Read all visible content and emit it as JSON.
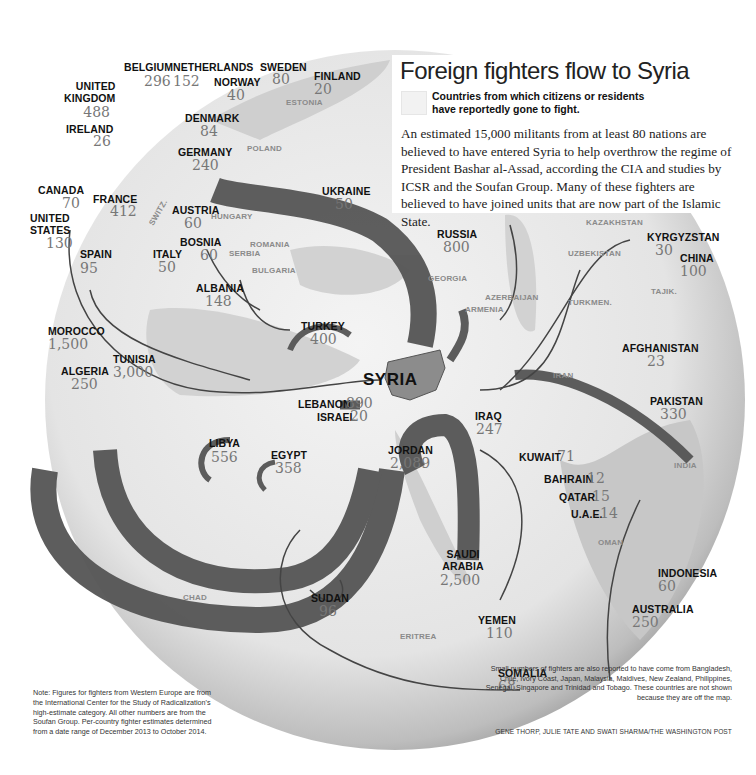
{
  "header": {
    "title": "Foreign fighters flow to Syria",
    "legend_label": "Countries from which citizens or residents have reportedly gone to fight.",
    "blurb": "An estimated 15,000 militants from at least 80 nations are believed to have entered Syria to help overthrow the regime of President Bashar al-Assad, according the CIA and studies by ICSR and the Soufan Group. Many of these fighters are believed to have joined units that are now part of the Islamic State."
  },
  "destination": {
    "label": "SYRIA"
  },
  "countries": [
    {
      "name": "UNITED KINGDOM",
      "line1": "UNITED",
      "line2": "KINGDOM",
      "value": "488"
    },
    {
      "name": "BELGIUM",
      "value": "296"
    },
    {
      "name": "NETHERLANDS",
      "value": "152"
    },
    {
      "name": "SWEDEN",
      "value": "80"
    },
    {
      "name": "FINLAND",
      "value": "20"
    },
    {
      "name": "NORWAY",
      "value": "40"
    },
    {
      "name": "DENMARK",
      "value": "84"
    },
    {
      "name": "IRELAND",
      "value": "26"
    },
    {
      "name": "GERMANY",
      "value": "240"
    },
    {
      "name": "CANADA",
      "value": "70"
    },
    {
      "name": "UNITED STATES",
      "line1": "UNITED",
      "line2": "STATES",
      "value": "130"
    },
    {
      "name": "FRANCE",
      "value": "412"
    },
    {
      "name": "AUSTRIA",
      "value": "60"
    },
    {
      "name": "BOSNIA",
      "value": "60"
    },
    {
      "name": "SPAIN",
      "value": "95"
    },
    {
      "name": "ITALY",
      "value": "50"
    },
    {
      "name": "ALBANIA",
      "value": "148"
    },
    {
      "name": "UKRAINE",
      "value": "50"
    },
    {
      "name": "RUSSIA",
      "value": "800"
    },
    {
      "name": "TURKEY",
      "value": "400"
    },
    {
      "name": "MOROCCO",
      "value": "1,500"
    },
    {
      "name": "ALGERIA",
      "value": "250"
    },
    {
      "name": "TUNISIA",
      "value": "3,000"
    },
    {
      "name": "LIBYA",
      "value": "556"
    },
    {
      "name": "EGYPT",
      "value": "358"
    },
    {
      "name": "LEBANON",
      "value": "890"
    },
    {
      "name": "ISRAEL",
      "value": "20"
    },
    {
      "name": "JORDAN",
      "value": "2,089"
    },
    {
      "name": "IRAQ",
      "value": "247"
    },
    {
      "name": "KUWAIT",
      "value": "71"
    },
    {
      "name": "BAHRAIN",
      "value": "12"
    },
    {
      "name": "QATAR",
      "value": "15"
    },
    {
      "name": "U.A.E.",
      "value": "14"
    },
    {
      "name": "SAUDI ARABIA",
      "line1": "SAUDI",
      "line2": "ARABIA",
      "value": "2,500"
    },
    {
      "name": "SUDAN",
      "value": "96"
    },
    {
      "name": "YEMEN",
      "value": "110"
    },
    {
      "name": "SOMALIA",
      "value": "68"
    },
    {
      "name": "KYRGYZSTAN",
      "value": "30"
    },
    {
      "name": "CHINA",
      "value": "100"
    },
    {
      "name": "AFGHANISTAN",
      "value": "23"
    },
    {
      "name": "PAKISTAN",
      "value": "330"
    },
    {
      "name": "INDONESIA",
      "value": "60"
    },
    {
      "name": "AUSTRALIA",
      "value": "250"
    }
  ],
  "geo_labels": [
    "ESTONIA",
    "POLAND",
    "HUNGARY",
    "SWITZ.",
    "ROMANIA",
    "SERBIA",
    "BULGARIA",
    "GEORGIA",
    "AZERBAIJAN",
    "ARMENIA",
    "KAZAKHSTAN",
    "UZBEKISTAN",
    "TURKMEN.",
    "TAJIK.",
    "IRAN",
    "INDIA",
    "OMAN",
    "CHAD",
    "ERITREA"
  ],
  "notes": {
    "left": "Note: Figures for fighters from Western Europe are from the International Center for the Study of Radicalization's high-estimate category. All other numbers are from the Soufan Group. Per-country fighter estimates determined from a date range of December 2013 to October 2014.",
    "right": "Small numbers of fighters are also reported to have come from Bangladesh, Chile, Ivory Coast, Japan, Malaysia, Maldives, New Zealand, Philippines, Senegal, Singapore and Trinidad and Tobago. These countries are not shown because they are off the map.",
    "credit": "GENE THORP, JULIE TATE AND SWATI SHARMA/THE WASHINGTON POST"
  },
  "colors": {
    "arrow": "#555555",
    "globe_land": "#e8e8e8",
    "globe_sea": "#d0d0d0",
    "syria_fill": "#8c8c8c",
    "number_gray": "#777777"
  }
}
